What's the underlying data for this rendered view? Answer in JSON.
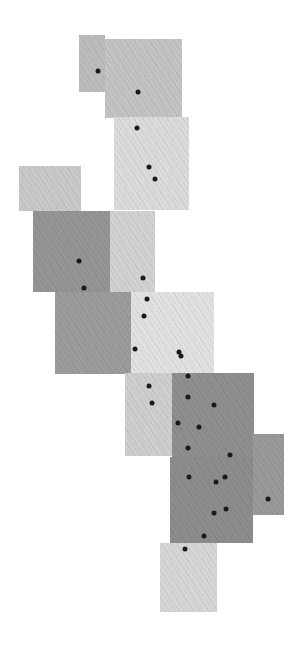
{
  "image": {
    "width": 305,
    "height": 645,
    "background": "#ffffff",
    "description": "Mosaic of overlapping grayscale textured image tiles arranged diagonally from top-left to bottom-right, with black dot markers"
  },
  "tiles": [
    {
      "id": "A",
      "x": 79,
      "y": 35,
      "w": 26,
      "h": 57,
      "color": "#bdbdbd"
    },
    {
      "id": "B",
      "x": 105,
      "y": 39,
      "w": 77,
      "h": 79,
      "color": "#c4c4c4"
    },
    {
      "id": "C",
      "x": 114,
      "y": 117,
      "w": 75,
      "h": 93,
      "color": "#dcdcdc"
    },
    {
      "id": "D",
      "x": 19,
      "y": 166,
      "w": 62,
      "h": 45,
      "color": "#c9c9c9"
    },
    {
      "id": "E",
      "x": 33,
      "y": 211,
      "w": 77,
      "h": 81,
      "color": "#959595"
    },
    {
      "id": "F",
      "x": 110,
      "y": 211,
      "w": 45,
      "h": 81,
      "color": "#d2d2d2"
    },
    {
      "id": "G",
      "x": 55,
      "y": 292,
      "w": 76,
      "h": 82,
      "color": "#9c9c9c"
    },
    {
      "id": "H",
      "x": 131,
      "y": 292,
      "w": 83,
      "h": 81,
      "color": "#e2e2e2"
    },
    {
      "id": "I",
      "x": 125,
      "y": 373,
      "w": 47,
      "h": 83,
      "color": "#cfcfcf"
    },
    {
      "id": "J",
      "x": 172,
      "y": 373,
      "w": 82,
      "h": 84,
      "color": "#8f8f8f"
    },
    {
      "id": "L",
      "x": 253,
      "y": 434,
      "w": 31,
      "h": 81,
      "color": "#9a9a9a"
    },
    {
      "id": "K",
      "x": 170,
      "y": 457,
      "w": 83,
      "h": 86,
      "color": "#8d8d8d"
    },
    {
      "id": "M",
      "x": 160,
      "y": 543,
      "w": 57,
      "h": 69,
      "color": "#d6d6d6"
    }
  ],
  "dots": [
    {
      "x": 98,
      "y": 71
    },
    {
      "x": 138,
      "y": 92
    },
    {
      "x": 137,
      "y": 128
    },
    {
      "x": 149,
      "y": 167
    },
    {
      "x": 155,
      "y": 179
    },
    {
      "x": 79,
      "y": 261
    },
    {
      "x": 84,
      "y": 288
    },
    {
      "x": 143,
      "y": 278
    },
    {
      "x": 147,
      "y": 299
    },
    {
      "x": 144,
      "y": 316
    },
    {
      "x": 135,
      "y": 349
    },
    {
      "x": 179,
      "y": 352
    },
    {
      "x": 181,
      "y": 356
    },
    {
      "x": 149,
      "y": 386
    },
    {
      "x": 152,
      "y": 403
    },
    {
      "x": 188,
      "y": 376
    },
    {
      "x": 188,
      "y": 397
    },
    {
      "x": 214,
      "y": 405
    },
    {
      "x": 178,
      "y": 423
    },
    {
      "x": 199,
      "y": 427
    },
    {
      "x": 188,
      "y": 448
    },
    {
      "x": 230,
      "y": 455
    },
    {
      "x": 189,
      "y": 477
    },
    {
      "x": 216,
      "y": 482
    },
    {
      "x": 225,
      "y": 477
    },
    {
      "x": 214,
      "y": 513
    },
    {
      "x": 226,
      "y": 509
    },
    {
      "x": 268,
      "y": 499
    },
    {
      "x": 204,
      "y": 536
    },
    {
      "x": 185,
      "y": 549
    }
  ],
  "dot_color": "#1a1a1a"
}
